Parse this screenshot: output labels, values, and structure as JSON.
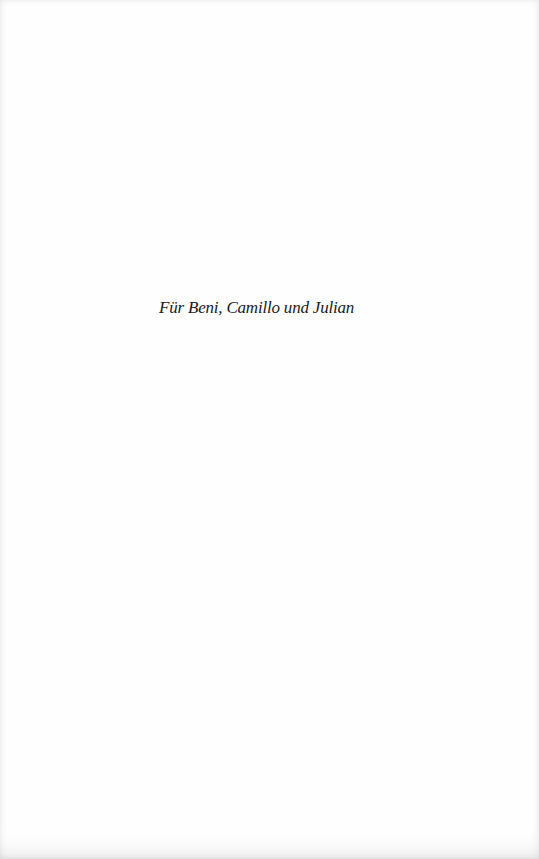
{
  "page": {
    "type": "dedication",
    "dedication_text": "Für Beni, Camillo und Julian",
    "background_color": "#fefefe",
    "text_color": "#1a1a1a"
  }
}
